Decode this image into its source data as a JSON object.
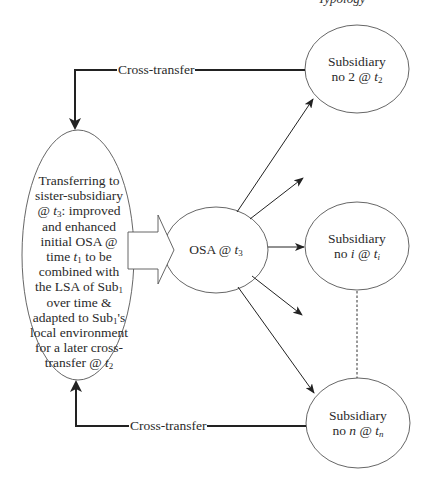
{
  "header": {
    "fragment": "Typology"
  },
  "nodes": {
    "source": {
      "lines": [
        "Transferring to",
        "sister-subsidiary",
        "@ t3: improved",
        "and enhanced",
        "initial OSA @",
        "time t1 to be",
        "combined with",
        "the LSA of Sub1",
        "over time &",
        "adapted to Sub1's",
        "local environment",
        "for a later cross-",
        "transfer @ t2"
      ],
      "parts": {
        "l1": "Transferring to",
        "l2": "sister-subsidiary",
        "l3a": "@ ",
        "l3t": "t",
        "l3s": "3",
        "l3b": ": improved",
        "l4": "and enhanced",
        "l5": "initial OSA @",
        "l6a": "time ",
        "l6t": "t",
        "l6s": "1",
        "l6b": " to be",
        "l7": "combined with",
        "l8a": "the LSA of Sub",
        "l8s": "1",
        "l9": "over time &",
        "l10a": "adapted to Sub",
        "l10s": "1",
        "l10b": "'s",
        "l11": "local environment",
        "l12": "for a later cross-",
        "l13a": "transfer @ ",
        "l13t": "t",
        "l13s": "2"
      }
    },
    "osa": {
      "label": "OSA @ ",
      "t": "t",
      "sub": "3"
    },
    "subsidiary_2": {
      "line1": "Subsidiary",
      "line2": "no 2 @ ",
      "t": "t",
      "sub": "2"
    },
    "subsidiary_i": {
      "line1": "Subsidiary",
      "line2a": "no ",
      "var": "i",
      "line2b": " @ ",
      "t": "t",
      "sub": "i"
    },
    "subsidiary_n": {
      "line1": "Subsidiary",
      "line2a": "no ",
      "var": "n",
      "line2b": " @ ",
      "t": "t",
      "sub": "n"
    }
  },
  "edges": {
    "cross_transfer_top": {
      "label": "Cross-transfer"
    },
    "cross_transfer_bottom": {
      "label": "Cross-transfer"
    }
  },
  "colors": {
    "line": "#222222",
    "ellipse_stroke": "#555555",
    "background": "#ffffff"
  }
}
